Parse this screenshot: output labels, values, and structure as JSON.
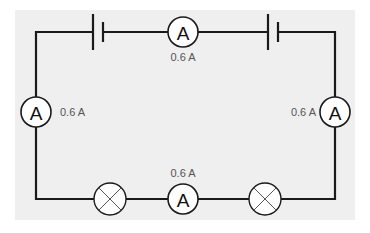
{
  "diagram": {
    "type": "series circuit",
    "background_color": "#efefef",
    "wire_color": "#1a1a1a",
    "batteries": [
      {
        "id": "battery-top-left"
      },
      {
        "id": "battery-top-right"
      }
    ],
    "ammeters": [
      {
        "id": "ammeter-top",
        "symbol": "A",
        "reading": "0.6 A"
      },
      {
        "id": "ammeter-left",
        "symbol": "A",
        "reading": "0.6 A"
      },
      {
        "id": "ammeter-right",
        "symbol": "A",
        "reading": "0.6 A"
      },
      {
        "id": "ammeter-bottom",
        "symbol": "A",
        "reading": "0.6 A"
      }
    ],
    "lamps": [
      {
        "id": "lamp-bottom-left"
      },
      {
        "id": "lamp-bottom-right"
      }
    ]
  }
}
